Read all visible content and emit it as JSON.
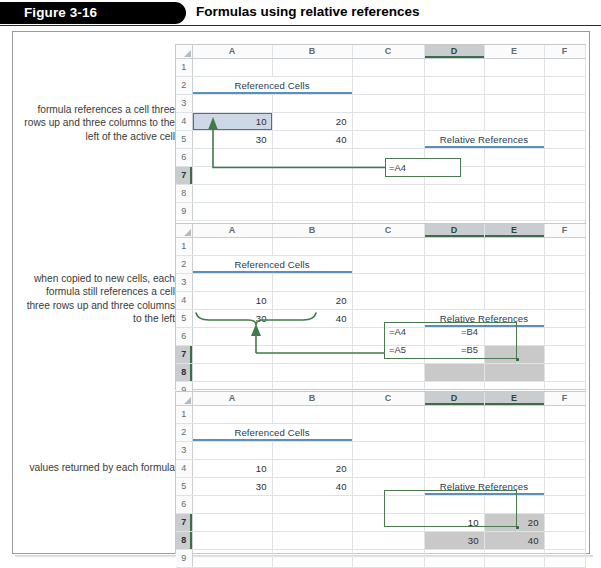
{
  "figure": {
    "tag": "Figure 3-16",
    "title": "Formulas using relative references"
  },
  "callouts": [
    {
      "id": "callout-1",
      "text": "formula references a cell three rows up and three columns to the left of the active cell"
    },
    {
      "id": "callout-2",
      "text": "when copied to new cells, each formula still references a cell three rows up and three columns to the left"
    },
    {
      "id": "callout-3",
      "text": "values returned by each formula"
    }
  ],
  "sheet": {
    "columns": [
      "A",
      "B",
      "C",
      "D",
      "E",
      "F"
    ],
    "rows": [
      "1",
      "2",
      "3",
      "4",
      "5",
      "6",
      "7",
      "8",
      "9"
    ],
    "headings": {
      "referenced_cells": "Referenced Cells",
      "relative_references": "Relative References"
    }
  },
  "panels": [
    {
      "id": "panel-1",
      "selected_columns": [
        "D"
      ],
      "selected_rows": [
        "7"
      ],
      "data": {
        "A4": "10",
        "B4": "20",
        "A5": "30",
        "B5": "40"
      },
      "formulas": {
        "D7": "=A4"
      },
      "active_cell": "A4",
      "selection_range": "D7"
    },
    {
      "id": "panel-2",
      "selected_columns": [
        "D",
        "E"
      ],
      "selected_rows": [
        "7",
        "8"
      ],
      "data": {
        "A4": "10",
        "B4": "20",
        "A5": "30",
        "B5": "40"
      },
      "formulas": {
        "D7": "=A4",
        "E7": "=B4",
        "D8": "=A5",
        "E8": "=B5"
      },
      "active_cell": "D7",
      "selection_range": "D7:E8"
    },
    {
      "id": "panel-3",
      "selected_columns": [
        "D",
        "E"
      ],
      "selected_rows": [
        "7",
        "8"
      ],
      "data": {
        "A4": "10",
        "B4": "20",
        "A5": "30",
        "B5": "40"
      },
      "results": {
        "D7": "10",
        "E7": "20",
        "D8": "30",
        "E8": "40"
      },
      "active_cell": "D7",
      "selection_range": "D7:E8"
    }
  ],
  "colors": {
    "accent_blue": "#5b8fb9",
    "heading_blue": "#1f3b52",
    "connector_green": "#3f7a4b",
    "selection_gray": "#c9c9c9",
    "selection_blue": "#cdd7e5",
    "header_gray": "#c9cdd0"
  }
}
